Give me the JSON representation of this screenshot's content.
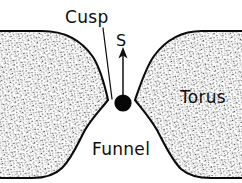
{
  "figure": {
    "kind": "scientific-line-diagram",
    "width": 242,
    "height": 183,
    "background_color": "#ffffff",
    "ink_color": "#0d0d0d",
    "stipple_color": "#3a3a3a"
  },
  "labels": {
    "cusp": "Cusp",
    "s": "S",
    "torus": "Torus",
    "funnel": "Funnel"
  },
  "annotations": {
    "cusp_leader": {
      "from_x": 104,
      "from_y": 27,
      "to_x": 112,
      "to_y": 99
    },
    "outflow_arrow": {
      "tail_x": 123,
      "tail_y": 95,
      "tip_x": 123,
      "tip_y": 50,
      "direction": "up"
    },
    "source_dot": {
      "cx": 123,
      "cy": 103,
      "r": 8.5
    },
    "cusp_tip_left": {
      "x": 108,
      "y": 100
    },
    "cusp_tip_right": {
      "x": 135,
      "y": 100
    }
  },
  "regions": [
    {
      "name": "left-torus-lobe",
      "label_shown": "Funnel",
      "fill": "stipple"
    },
    {
      "name": "right-torus-lobe",
      "label_shown": "Torus",
      "fill": "stipple"
    }
  ]
}
